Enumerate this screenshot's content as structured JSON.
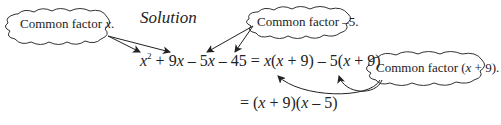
{
  "title": "Solution",
  "callouts": [
    {
      "id": "x",
      "prefix": "Common factor ",
      "var": "x",
      "suffix": "."
    },
    {
      "id": "neg5",
      "prefix": "Common factor –5.",
      "var": "",
      "suffix": ""
    },
    {
      "id": "xplus9",
      "prefix": "Common factor (",
      "var": "x",
      "suffix": " + 9)."
    }
  ],
  "equation": {
    "line1": {
      "t1_var": "x",
      "t1_exp": "2",
      "t2": " + 9",
      "t2_var": "x",
      "t3": " – 5",
      "t3_var": "x",
      "t4": " – 45 = ",
      "t5_var": "x",
      "t5": "(",
      "t6_var": "x",
      "t6": " + 9) – 5(",
      "t7_var": "x",
      "t7": " + 9)"
    },
    "line2": {
      "p1": "= (",
      "v1": "x",
      "p2": " + 9)(",
      "v2": "x",
      "p3": " – 5)"
    }
  },
  "colors": {
    "ink": "#222222",
    "background": "#ffffff"
  }
}
